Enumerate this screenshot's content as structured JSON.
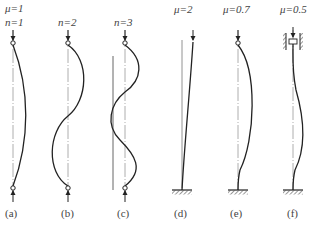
{
  "figure": {
    "columns": [
      {
        "id": "a",
        "label": "(a)",
        "mu": "μ=1",
        "n": "n=1"
      },
      {
        "id": "b",
        "label": "(b)",
        "n": "n=2"
      },
      {
        "id": "c",
        "label": "(c)",
        "n": "n=3"
      },
      {
        "id": "d",
        "label": "(d)",
        "mu": "μ=2"
      },
      {
        "id": "e",
        "label": "(e)",
        "mu": "μ=0.7"
      },
      {
        "id": "f",
        "label": "(f)",
        "mu": "μ=0.5"
      }
    ],
    "colors": {
      "line": "#2a2a2a",
      "axis": "#888888"
    }
  }
}
